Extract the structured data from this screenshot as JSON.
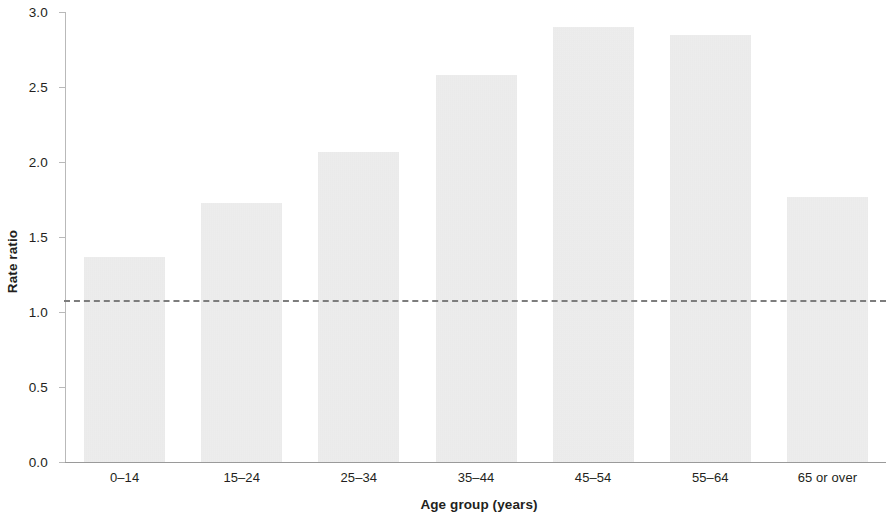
{
  "chart_data": {
    "type": "bar",
    "title": "",
    "subtitle": "",
    "xlabel": "Age group (years)",
    "ylabel": "Rate ratio",
    "categories": [
      "0–14",
      "15–24",
      "25–34",
      "35–44",
      "45–54",
      "55–64",
      "65 or over"
    ],
    "values": [
      1.37,
      1.73,
      2.07,
      2.58,
      2.9,
      2.85,
      1.77
    ],
    "series": [
      {
        "name": "Rate ratio",
        "values": [
          1.37,
          1.73,
          2.07,
          2.58,
          2.9,
          2.85,
          1.77
        ]
      }
    ],
    "ylim": [
      0.0,
      3.0
    ],
    "ytick_values": [
      0.0,
      0.5,
      1.0,
      1.5,
      2.0,
      2.5,
      3.0
    ],
    "ytick_labels": [
      "0.0",
      "0.5",
      "1.0",
      "1.5",
      "2.0",
      "2.5",
      "3.0"
    ],
    "grid": false,
    "legend": null,
    "legend_position": "none",
    "annotations": [
      {
        "name": "reference-line",
        "type": "hline",
        "value": 1.08,
        "style": "dashed",
        "color": "#7d7d7d"
      }
    ],
    "colors": {
      "bar_fill": "#e9e9e9",
      "axis": "#9a9a9a",
      "text": "#231f20",
      "reference_line": "#7d7d7d",
      "background": "#ffffff"
    }
  }
}
